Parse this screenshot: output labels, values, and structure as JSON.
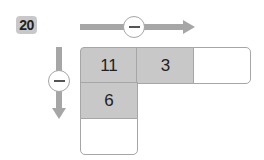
{
  "problem_number": "20",
  "operations": {
    "horizontal": {
      "symbol": "−",
      "direction": "right"
    },
    "vertical": {
      "symbol": "−",
      "direction": "down"
    }
  },
  "grid": {
    "row1": [
      "11",
      "3",
      ""
    ],
    "col1": [
      "11",
      "6",
      ""
    ]
  },
  "colors": {
    "cell_fill": "#c8c8c8",
    "arrow": "#a6a6a6",
    "badge": "#c8c8c8"
  }
}
